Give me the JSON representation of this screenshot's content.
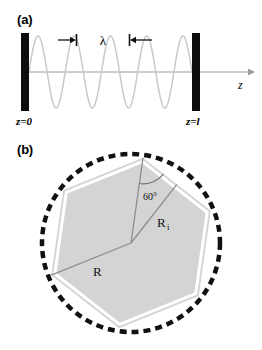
{
  "figure": {
    "width": 262,
    "height": 350,
    "background": "#ffffff"
  },
  "panel_a": {
    "label": "(a)",
    "description": "standing-wave-in-cavity",
    "axis_label": "z",
    "wavelength_label": "λ",
    "left_mirror_label": "z=0",
    "right_mirror_label": "z=l",
    "mirror_color": "#0d0d0d",
    "wave_color": "#c9c9c9",
    "axis_color": "#9a9a9a",
    "arrow_color": "#111111",
    "wave_cycles": 4.5,
    "left_mirror": {
      "x": 21,
      "y": 33,
      "w": 8,
      "h": 78
    },
    "right_mirror": {
      "x": 192,
      "y": 33,
      "w": 8,
      "h": 78
    },
    "axis_y": 72,
    "axis_end_x": 252,
    "wave_amplitude": 36,
    "lambda_span": {
      "x1": 72,
      "x2": 133,
      "y": 40
    }
  },
  "panel_b": {
    "label": "(b)",
    "description": "hexagon-inscribed-in-dashed-circle",
    "radius_vertex_label": "R",
    "radius_inradius_label": "R",
    "radius_inradius_subscript": "i",
    "angle_label": "60°",
    "circle": {
      "cx": 131,
      "cy": 93,
      "r": 89
    },
    "hexagon_circumradius": 86,
    "hexagon_rotation_deg": 8,
    "center_dot": {
      "cx": 131,
      "cy": 93
    },
    "fill_color": "#d4d4d4",
    "edge_color": "#ffffff",
    "dash_color": "#111111",
    "line_color": "#8d8d8d",
    "dash_pattern": "7 5",
    "dash_width": 4.5
  }
}
